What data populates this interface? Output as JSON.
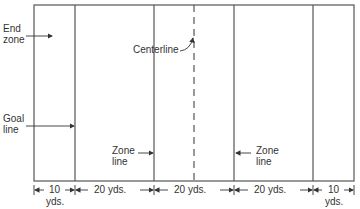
{
  "diagram": {
    "type": "playing-field-layout",
    "labels": {
      "end_zone_line1": "End",
      "end_zone_line2": "zone",
      "goal_line_line1": "Goal",
      "goal_line_line2": "line",
      "centerline": "Centerline",
      "zone_line_left_line1": "Zone",
      "zone_line_left_line2": "line",
      "zone_line_right_line1": "Zone",
      "zone_line_right_line2": "line"
    },
    "dimensions": [
      {
        "value": "10",
        "unit": "yds."
      },
      {
        "value": "20 yds.",
        "unit": ""
      },
      {
        "value": "20 yds.",
        "unit": ""
      },
      {
        "value": "20 yds.",
        "unit": ""
      },
      {
        "value": "10",
        "unit": "yds."
      }
    ],
    "colors": {
      "line": "#444444",
      "text": "#333333",
      "background": "#ffffff"
    }
  }
}
